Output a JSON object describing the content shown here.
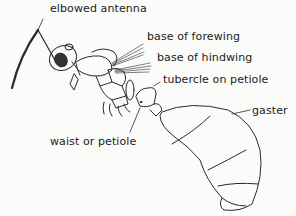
{
  "diagram": {
    "labels": [
      {
        "id": "elbowed_antenna",
        "text": "elbowed antenna",
        "x": 50,
        "y": 9
      },
      {
        "id": "base_of_forewing",
        "text": "base of forewing",
        "x": 147,
        "y": 37
      },
      {
        "id": "base_of_hindwing",
        "text": "base of hindwing",
        "x": 157,
        "y": 58
      },
      {
        "id": "tubercle_on_petiole",
        "text": "tubercle on petiole",
        "x": 163,
        "y": 80
      },
      {
        "id": "gaster",
        "text": "gaster",
        "x": 252,
        "y": 111
      },
      {
        "id": "waist_or_petiole",
        "text": "waist or petiole",
        "x": 50,
        "y": 136
      }
    ]
  }
}
